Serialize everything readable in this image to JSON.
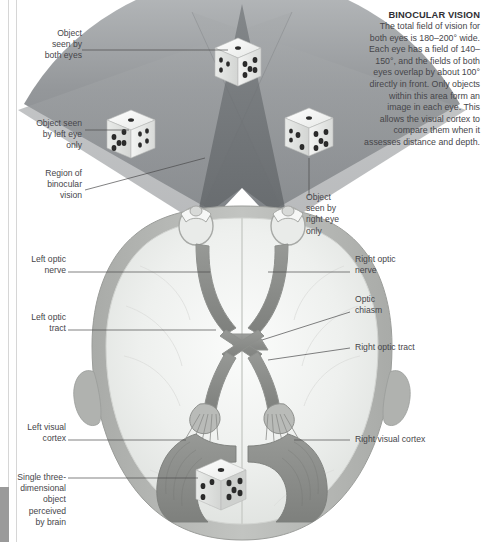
{
  "figure": {
    "background": "#ffffff"
  },
  "info_panel": {
    "title": "BINOCULAR VISION",
    "body": "The total field of vision for both eyes is 180–200° wide. Each eye has a field of 140–150°, and the fields of both eyes overlap by about 100° directly in front. Only objects within this area form an image in each eye. This allows the visual cortex to compare them when it assesses distance and depth."
  },
  "labels": {
    "object_both_eyes": "Object\nseen by\nboth eyes",
    "object_left_eye": "Object seen\nby left eye\nonly",
    "region_binocular": "Region of\nbinocular\nvision",
    "object_right_eye": "Object\nseen by\nright eye\nonly",
    "left_optic_nerve": "Left optic\nnerve",
    "right_optic_nerve": "Right optic\nnerve",
    "left_optic_tract": "Left optic\ntract",
    "right_optic_tract": "Right optic tract",
    "optic_chiasm": "Optic\nchiasm",
    "left_visual_cortex": "Left visual\ncortex",
    "right_visual_cortex": "Right visual cortex",
    "single_3d_object": "Single three-\ndimensional\nobject\nperceived\nby brain"
  },
  "dice": [
    {
      "name": "dice-center-far",
      "top_face": 1,
      "right_face": 5,
      "left_face": 3
    },
    {
      "name": "dice-left",
      "top_face": 1,
      "right_face": 5,
      "left_face": 3
    },
    {
      "name": "dice-right",
      "top_face": 1,
      "right_face": 5,
      "left_face": 3
    },
    {
      "name": "dice-brain",
      "top_face": 1,
      "right_face": 5,
      "left_face": 3
    }
  ],
  "colors": {
    "field_far": "#8e9194",
    "field_mid": "#a9acae",
    "field_overlap": "#6f7376",
    "skull": "#b4b6b3",
    "brain": "#eceeec",
    "optic_pathway": "#9d9f9c",
    "visual_cortex": "#8b8d8a",
    "text": "#46464a",
    "leader": "#4a4a4c"
  }
}
